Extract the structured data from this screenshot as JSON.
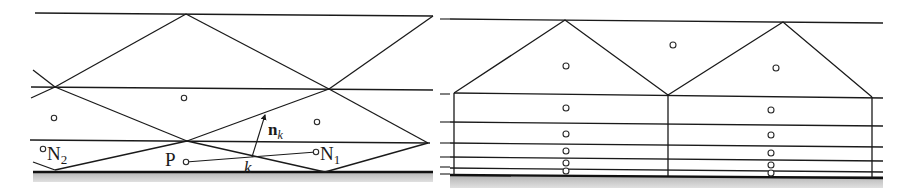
{
  "figure": {
    "left_panel": {
      "labels": {
        "n2": "N",
        "n2_sub": "2",
        "n1": "N",
        "n1_sub": "1",
        "p": "P",
        "normal_vec": "n",
        "normal_sub": "k",
        "face": "k"
      }
    },
    "right_panel": {},
    "colors": {
      "line": "#1a1a1a",
      "ground_band": "#c8c8c8",
      "background": "#ffffff"
    }
  }
}
